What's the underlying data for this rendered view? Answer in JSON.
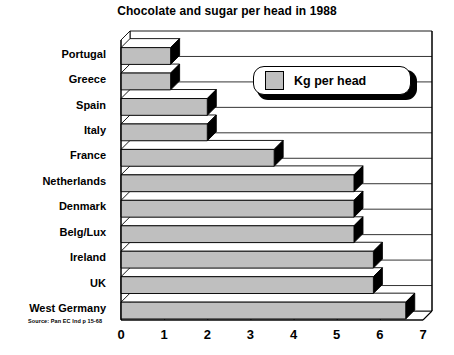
{
  "chart_data": {
    "type": "bar",
    "orientation": "horizontal",
    "title": "Chocolate and sugar per head in 1988",
    "xlabel": "",
    "ylabel": "",
    "xlim": [
      0,
      7
    ],
    "xticks": [
      "0",
      "1",
      "2",
      "3",
      "4",
      "5",
      "6",
      "7"
    ],
    "grid": true,
    "legend_position": "top-right",
    "categories": [
      "Portugal",
      "Greece",
      "Spain",
      "Italy",
      "France",
      "Netherlands",
      "Denmark",
      "Belg/Lux",
      "Ireland",
      "UK",
      "West Germany"
    ],
    "series": [
      {
        "name": "Kg per head",
        "values": [
          1.15,
          1.15,
          2.0,
          2.0,
          3.55,
          5.4,
          5.4,
          5.4,
          5.85,
          5.85,
          6.6
        ]
      }
    ],
    "colors": {
      "bar_face": "#bfbfbf",
      "bar_side": "#000000",
      "bar_top": "#ffffff",
      "outline": "#000000",
      "background": "#ffffff",
      "grid": "#000000"
    }
  },
  "legend": {
    "label": "Kg per head",
    "swatch_color": "#bfbfbf"
  },
  "source": {
    "note": "Source: Pan EC Ind p 15-68"
  }
}
